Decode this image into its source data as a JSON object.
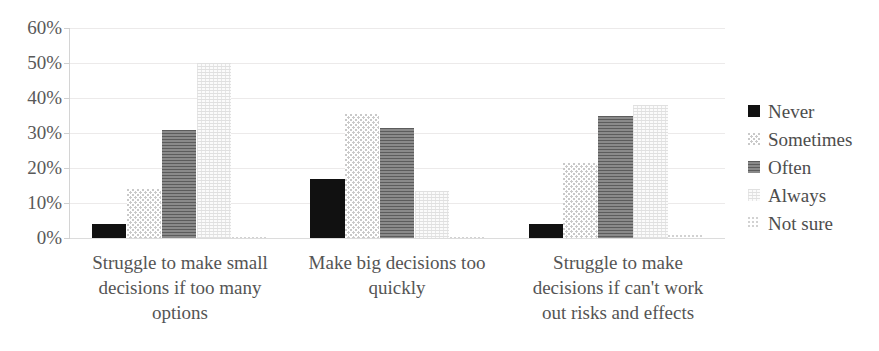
{
  "chart_data": {
    "type": "bar",
    "title": "",
    "subtitle": "",
    "xlabel": "",
    "ylabel": "",
    "ylim": [
      0,
      60
    ],
    "y_tick_labels": [
      "60%",
      "50%",
      "40%",
      "30%",
      "20%",
      "10%",
      "0%"
    ],
    "y_tick_values": [
      60,
      50,
      40,
      30,
      20,
      10,
      0
    ],
    "grid": true,
    "legend_position": "right",
    "categories": [
      "Struggle to make small decisions if too many options",
      "Make big decisions too quickly",
      "Struggle to make decisions if can't work out risks and effects"
    ],
    "category_lines": [
      [
        "Struggle to make small",
        "decisions if too many",
        "options"
      ],
      [
        "Make big decisions too",
        "quickly",
        ""
      ],
      [
        "Struggle to make",
        "decisions if can't work",
        "out risks and effects"
      ]
    ],
    "series": [
      {
        "name": "Never",
        "values": [
          4,
          17,
          4
        ],
        "color": "#111111",
        "pattern": "solid"
      },
      {
        "name": "Sometimes",
        "values": [
          14,
          35.5,
          21.5
        ],
        "color": "#c9c9c9",
        "pattern": "dots"
      },
      {
        "name": "Often",
        "values": [
          31,
          31.5,
          35
        ],
        "color": "#6e6e6e",
        "pattern": "horizontal-lines"
      },
      {
        "name": "Always",
        "values": [
          50,
          13.5,
          38
        ],
        "color": "#e2e2e2",
        "pattern": "fine-grid"
      },
      {
        "name": "Not sure",
        "values": [
          0.3,
          0.3,
          1
        ],
        "color": "#d2d2d2",
        "pattern": "sparse-dots"
      }
    ]
  },
  "legend": {
    "items": [
      {
        "label": "Never"
      },
      {
        "label": "Sometimes"
      },
      {
        "label": "Often"
      },
      {
        "label": "Always"
      },
      {
        "label": "Not sure"
      }
    ]
  }
}
